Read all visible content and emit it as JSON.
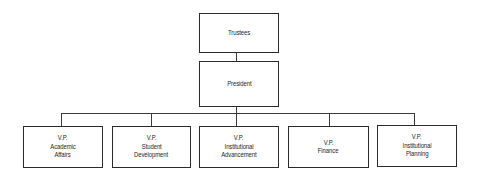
{
  "diagram": {
    "type": "org-chart",
    "colors": {
      "line": "#2a2a2a",
      "text": "#1e1e1e",
      "background": "#ffffff"
    },
    "top": {
      "label": "Trustees"
    },
    "second": {
      "label": "President"
    },
    "vps": [
      {
        "line1": "V.P.",
        "line2": "Academic",
        "line3": "Affairs"
      },
      {
        "line1": "V.P.",
        "line2": "Student",
        "line3": "Development"
      },
      {
        "line1": "V.P.",
        "line2": "Institutional",
        "line3": "Advancement"
      },
      {
        "line1": "V.P.",
        "line2": "Finance",
        "line3": ""
      },
      {
        "line1": "V.P.",
        "line2": "Institutional",
        "line3": "Planning"
      }
    ]
  }
}
